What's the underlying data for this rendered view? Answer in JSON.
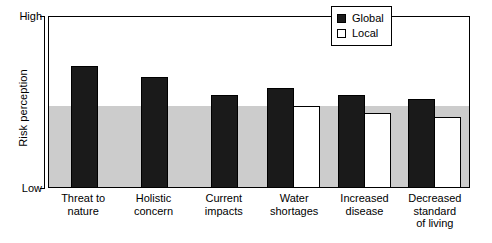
{
  "chart_data": {
    "type": "bar",
    "title": "",
    "xlabel": "",
    "ylabel": "Risk perception",
    "ylim": [
      0,
      100
    ],
    "ytick_labels": [
      "High",
      "Low"
    ],
    "grid": false,
    "legend_position": "top-right",
    "categories": [
      "Threat to\nnature",
      "Holistic\nconcern",
      "Current\nimpacts",
      "Water\nshortages",
      "Increased\ndisease",
      "Decreased\nstandard\nof living"
    ],
    "series": [
      {
        "name": "Global",
        "color": "#1a1a1a",
        "values": [
          71.5,
          65.1,
          54.7,
          58.7,
          54.7,
          52.3
        ]
      },
      {
        "name": "Local",
        "color": "#ffffff",
        "values": [
          null,
          null,
          null,
          48.3,
          44.2,
          41.9
        ]
      }
    ],
    "shaded_band": {
      "label": "",
      "color": "#cccccc",
      "from": 0,
      "to": 48.3
    }
  },
  "axes": {
    "y_title": "Risk perception",
    "y_high_label": "High",
    "y_low_label": "Low"
  },
  "legend": {
    "items": [
      {
        "label": "Global",
        "swatch": "filled-square-icon"
      },
      {
        "label": "Local",
        "swatch": "open-square-icon"
      }
    ]
  },
  "x_labels": [
    "Threat to\nnature",
    "Holistic\nconcern",
    "Current\nimpacts",
    "Water\nshortages",
    "Increased\ndisease",
    "Decreased\nstandard\nof living"
  ]
}
